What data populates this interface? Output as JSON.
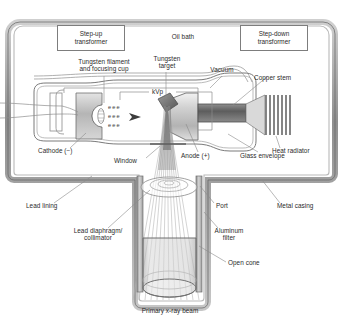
{
  "figure": {
    "bg_color": "#ffffff",
    "line_color": "#6e6e6e",
    "text_color": "#2b2b2b",
    "casing_color": "#9a9a9a"
  },
  "boxes": [
    {
      "id": "step-up",
      "label": "Step-up\ntransformer"
    },
    {
      "id": "step-down",
      "label": "Step-down\ntransformer"
    }
  ],
  "labels": {
    "oil_bath": "Oil bath",
    "tungsten_filament": "Tungsten filament\nand focusing cup",
    "tungsten_target": "Tungsten\ntarget",
    "vacuum": "Vacuum",
    "copper_stem": "Copper stem",
    "heat_radiator": "Heat radiator",
    "glass_envelope": "Glass envelope",
    "anode": "Anode (+)",
    "cathode": "Cathode (−)",
    "window": "Window",
    "kvp": "kVp",
    "lead_lining": "Lead lining",
    "lead_diaphragm": "Lead diaphragm/\ncollimator",
    "port": "Port",
    "metal_casing": "Metal casing",
    "aluminum_filter": "Aluminum\nfilter",
    "open_cone": "Open cone",
    "primary_beam": "Primary x-ray beam",
    "electrons_row": "eee"
  }
}
